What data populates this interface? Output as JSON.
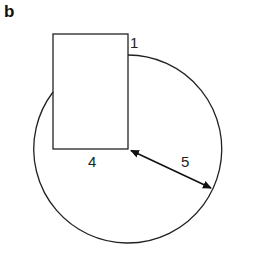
{
  "panel_label": "b",
  "labels": {
    "corner": "1",
    "rect_width": "4",
    "radius": "5"
  },
  "shapes": {
    "rectangle": {
      "x": 53,
      "y": 34,
      "width": 75,
      "height": 115
    },
    "circle": {
      "cx": 128,
      "cy": 149,
      "r": 94,
      "note": "center at bottom-right corner of rectangle"
    },
    "radius_arrow": {
      "from": [
        128,
        149
      ],
      "to": [
        213,
        189
      ],
      "double_headed": true
    }
  },
  "colors": {
    "stroke": "#222222",
    "background": "#ffffff"
  }
}
